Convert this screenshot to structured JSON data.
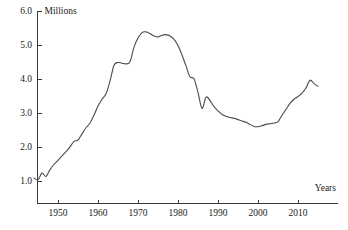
{
  "chart_data": {
    "type": "line",
    "title": "",
    "subtitle": "",
    "xlabel": "Years",
    "ylabel": "Millions",
    "xlim": [
      1944,
      2015.5
    ],
    "ylim": [
      0.62,
      6.0
    ],
    "grid": false,
    "legend": null,
    "annotations": [],
    "x_ticks": [
      1950,
      1960,
      1970,
      1980,
      1990,
      2000,
      2010
    ],
    "x_tick_labels": [
      "1950",
      "1960",
      "1970",
      "1980",
      "1990",
      "2000",
      "2010"
    ],
    "y_ticks": [
      1.0,
      2.0,
      3.0,
      4.0,
      5.0,
      6.0
    ],
    "y_tick_labels": [
      "1.0",
      "2.0",
      "3.0",
      "4.0",
      "5.0",
      "6.0"
    ],
    "series": [
      {
        "name": "value",
        "color": "#4a4a4a",
        "x": [
          1944,
          1945,
          1946,
          1947,
          1948,
          1949,
          1950,
          1951,
          1952,
          1953,
          1954,
          1955,
          1956,
          1957,
          1958,
          1959,
          1960,
          1961,
          1962,
          1963,
          1964,
          1965,
          1966,
          1967,
          1968,
          1969,
          1970,
          1971,
          1972,
          1973,
          1974,
          1975,
          1976,
          1977,
          1978,
          1979,
          1980,
          1981,
          1982,
          1983,
          1984,
          1985,
          1986,
          1987,
          1988,
          1989,
          1990,
          1991,
          1992,
          1993,
          1994,
          1995,
          1996,
          1997,
          1998,
          1999,
          2000,
          2001,
          2002,
          2003,
          2004,
          2005,
          2006,
          2007,
          2008,
          2009,
          2010,
          2011,
          2012,
          2013,
          2014,
          2015
        ],
        "values": [
          1.1,
          1.05,
          1.25,
          1.15,
          1.35,
          1.5,
          1.62,
          1.75,
          1.88,
          2.02,
          2.18,
          2.22,
          2.4,
          2.58,
          2.72,
          2.95,
          3.22,
          3.42,
          3.58,
          3.95,
          4.42,
          4.5,
          4.48,
          4.46,
          4.52,
          4.95,
          5.22,
          5.38,
          5.4,
          5.35,
          5.28,
          5.25,
          5.3,
          5.32,
          5.28,
          5.18,
          5.0,
          4.72,
          4.4,
          4.08,
          4.02,
          3.62,
          3.15,
          3.48,
          3.38,
          3.2,
          3.08,
          2.98,
          2.92,
          2.88,
          2.86,
          2.82,
          2.78,
          2.74,
          2.68,
          2.62,
          2.61,
          2.64,
          2.68,
          2.7,
          2.72,
          2.76,
          2.95,
          3.12,
          3.3,
          3.42,
          3.5,
          3.6,
          3.75,
          3.98,
          3.88,
          3.8
        ]
      }
    ]
  },
  "labels": {
    "y_axis_title": "Millions",
    "x_axis_title": "Years"
  }
}
